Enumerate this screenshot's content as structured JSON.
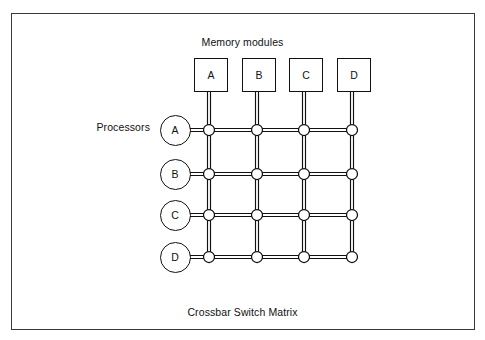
{
  "figure": {
    "title": "Memory modules",
    "caption": "Crossbar Switch Matrix",
    "processors_label": "Processors",
    "border_color": "#3a3a3a",
    "line_color": "#111111",
    "background_color": "#ffffff"
  },
  "memory_modules": [
    {
      "label": "A",
      "x": 194,
      "y": 58
    },
    {
      "label": "B",
      "x": 242,
      "y": 58
    },
    {
      "label": "C",
      "x": 289,
      "y": 58
    },
    {
      "label": "D",
      "x": 337,
      "y": 58
    }
  ],
  "processors": [
    {
      "label": "A",
      "cx": 175,
      "cy": 130
    },
    {
      "label": "B",
      "cx": 175,
      "cy": 174
    },
    {
      "label": "C",
      "cx": 175,
      "cy": 215
    },
    {
      "label": "D",
      "cx": 175,
      "cy": 257
    }
  ],
  "crossbar": {
    "rows": 4,
    "columns": 4,
    "column_x": [
      209,
      257,
      304,
      352
    ],
    "row_y": [
      130,
      174,
      215,
      257
    ],
    "bus_style": "double-line",
    "bus_gap": 3,
    "crosspoint_radius": 5.5,
    "crosspoint_count": 16,
    "column_top_y": 92,
    "row_left_x": 190
  }
}
